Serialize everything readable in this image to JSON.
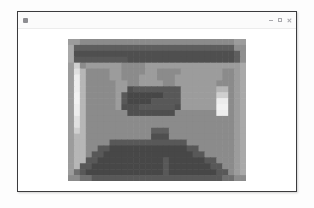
{
  "window": {
    "title": "",
    "app_icon": "app-grid-icon",
    "controls": [
      {
        "name": "minimize-button",
        "glyph": "minimize-icon",
        "label": ""
      },
      {
        "name": "maximize-button",
        "glyph": "maximize-icon",
        "label": ""
      },
      {
        "name": "close-button",
        "glyph": "close-icon",
        "label": ""
      }
    ],
    "frame_color": "#3b3b3d",
    "titlebar_color": "#fbfbfb",
    "content_color": "#ffffff"
  },
  "viewer": {
    "image_alt": "heavily pixelated grayscale photograph",
    "image_name": "pixelated-grayscale-photo",
    "block_size_px": 6,
    "grid_cols": 30,
    "grid_rows": 24,
    "palette": {
      "darkest": "#3f3f3f",
      "dark": "#555555",
      "mid_dark": "#6b6b6b",
      "mid": "#808080",
      "mid_light": "#999999",
      "light": "#b4b4b4",
      "lightest": "#e2e2e2"
    },
    "mosaic_rows": [
      "GGHHHHHHHHHHHHHHHHHHHHHHHHHHGG",
      "FDDDDDDDDDDDDDDDDDDDDDDDDDDDEE",
      "FCCCCCCCCCCCCCCCCCCCCCCCCCCCDE",
      "FBBBBBBBBBCCCCCCCCCCCCCCCCCCDE",
      "GKHGGGGGGHHHHGGGGGGGGGGGGGGGGF",
      "GLJHHHHGGHHHHGGHHHHGGGGGGGHHGF",
      "GMJHHHHGGHHHGGGHHHGGGGGGGGHHGF",
      "GMJHHHHHGGHHGGGGHHGGGGGGGHHHGF",
      "GMJHHHHHGGCBBBBBBBBGGGGGGJJHGF",
      "GNJHHHHHGBAAAAAABBBGGGGGGKKHGF",
      "GNJHHHHHGBAAAABBBBBGGGGGGMMHGF",
      "GMJHHHHHGCCCBBBBBBCGGGGGGNNHGF",
      "GMJHHHHHHHCCCCCCCCHHHHHHHMMHGF",
      "GLJHHHHHHHHHHHHHHHHHHHHHHHHHGF",
      "GLJHHHHHHHHHHHHHHHHHHHHHHHHHGF",
      "GKJHHHHHHHHHHHDDDHHHHHHHHHHHGF",
      "GJJHHHHHHHHHHHCCCHHHHHHHHHHHGF",
      "GJJHHHHBBBBBBBBBBBBBHHHHHHHHGF",
      "GJJHHBBAAAAAAAAAAAAABBHHHHHHGF",
      "GJJHBBAAAAAAAAAAAAAAABBHHHHHGF",
      "GJJBBAAAAAAAAAAABAAAAAABBHHHGF",
      "GJBBAAAAAAAAAAAABAAAAAAABBHHGF",
      "GIBAAAAAAAAAAAAABAAAAAAAABBHGF",
      "HHIIBBBBBBBBBBBBBBBBBBBBBBIIHH"
    ],
    "palette_map": {
      "A": "#474747",
      "B": "#585858",
      "C": "#4f4f4f",
      "D": "#5e5e5e",
      "E": "#8f8f8f",
      "F": "#a9a9a9",
      "G": "#9c9c9c",
      "H": "#8b8b8b",
      "I": "#6f6f6f",
      "J": "#b6b6b6",
      "K": "#cfcfcf",
      "L": "#e0e0e0",
      "M": "#ededed",
      "N": "#f2f2f2"
    }
  }
}
